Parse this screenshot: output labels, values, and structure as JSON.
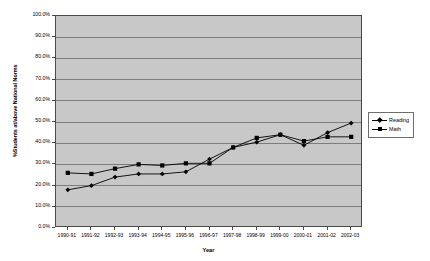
{
  "chart_data": {
    "type": "line",
    "title": "",
    "xlabel": "Year",
    "ylabel": "%Students at/above National Norms",
    "ylim": [
      0,
      100
    ],
    "ytick_labels": [
      "100.0%",
      "90.0%",
      "80.0%",
      "70.0%",
      "60.0%",
      "50.0%",
      "40.0%",
      "30.0%",
      "20.0%",
      "10.0%",
      "0.0%"
    ],
    "ytick_values": [
      100,
      90,
      80,
      70,
      60,
      50,
      40,
      30,
      20,
      10,
      0
    ],
    "grid": true,
    "legend_position": "right",
    "categories": [
      "1990-91",
      "1991-92",
      "1992-93",
      "1993-94",
      "1994-95",
      "1995-96",
      "1996-97",
      "1997-98",
      "1998-99",
      "1999-00",
      "2000-01",
      "2001-02",
      "2002-03"
    ],
    "series": [
      {
        "name": "Reading",
        "marker": "diamond",
        "values": [
          18.0,
          20.0,
          24.0,
          25.5,
          25.5,
          26.5,
          32.5,
          38.0,
          40.5,
          44.0,
          39.0,
          45.0,
          49.5
        ]
      },
      {
        "name": "Math",
        "marker": "square",
        "values": [
          26.0,
          25.5,
          28.0,
          30.0,
          29.5,
          30.5,
          30.5,
          38.0,
          42.5,
          44.0,
          41.0,
          43.0,
          43.0
        ]
      }
    ],
    "colors": {
      "plot_background": "#c8c8c8",
      "page_background": "#ffffff",
      "gridline": "#7d7d7d",
      "axis": "#4a4a4a",
      "series_line": "#000000",
      "text": "#000000"
    }
  }
}
